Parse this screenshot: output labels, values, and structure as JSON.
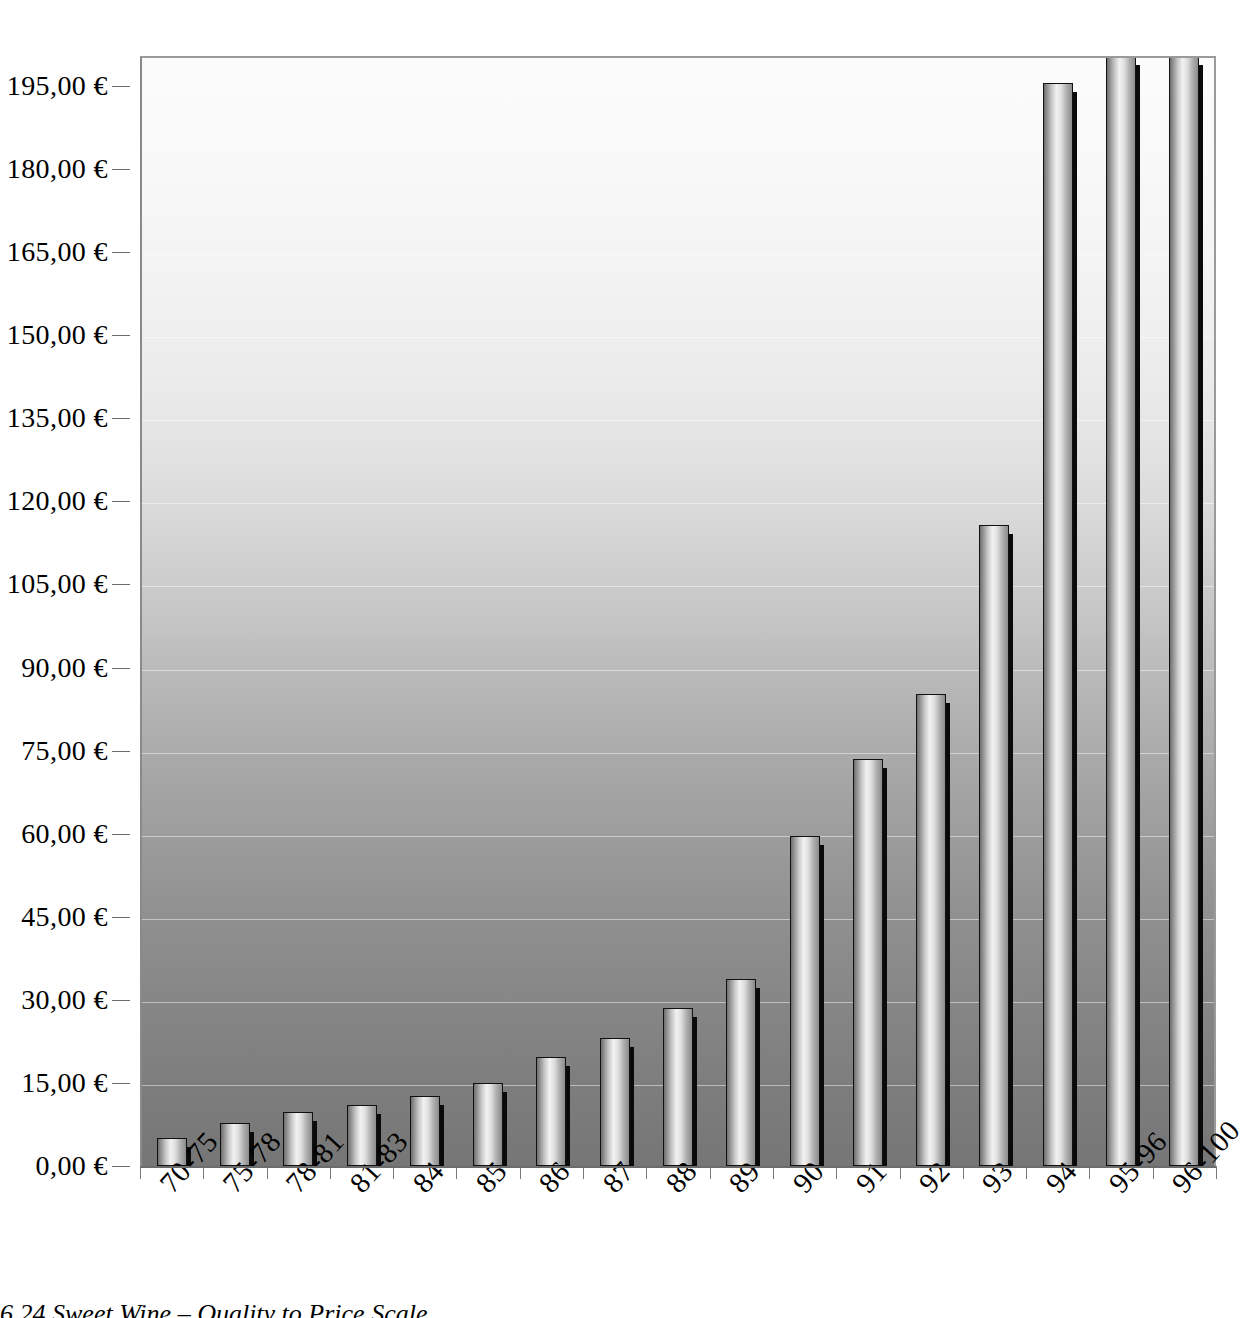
{
  "caption": "6.24  Sweet Wine – Quality to Price Scale",
  "chart_data": {
    "type": "bar",
    "title": "6.24  Sweet Wine – Quality to Price Scale",
    "xlabel": "",
    "ylabel": "",
    "currency_symbol": "€",
    "decimal_separator": ",",
    "grid": true,
    "legend": "none",
    "ylim": [
      0,
      210
    ],
    "yticks": [
      0,
      15,
      30,
      45,
      60,
      75,
      90,
      105,
      120,
      135,
      150,
      165,
      180,
      195
    ],
    "ytick_labels": [
      "0,00 €",
      "15,00 €",
      "30,00 €",
      "45,00 €",
      "60,00 €",
      "75,00 €",
      "90,00 €",
      "105,00 €",
      "120,00 €",
      "135,00 €",
      "150,00 €",
      "165,00 €",
      "180,00 €",
      "195,00 €"
    ],
    "categories": [
      "70-75",
      "75-78",
      "78-81",
      "81-83",
      "84",
      "85",
      "86",
      "87",
      "88",
      "89",
      "90",
      "91",
      "92",
      "93",
      "94",
      "95-96",
      "96-100"
    ],
    "values": [
      5.0,
      7.8,
      9.7,
      11.0,
      12.6,
      14.9,
      19.7,
      23.2,
      28.5,
      33.7,
      59.6,
      73.5,
      85.3,
      115.8,
      195.5,
      245.0,
      250.0
    ],
    "clipped_bars": [
      "95-96",
      "96-100"
    ]
  },
  "colors": {
    "background_top": "#fbfbfb",
    "background_bottom": "#767676",
    "bar_highlight": "#f2f2f2",
    "bar_shadow": "#0a0a0a",
    "axis": "#6b6b6b",
    "gridline": "#ffffff",
    "text": "#000000"
  }
}
